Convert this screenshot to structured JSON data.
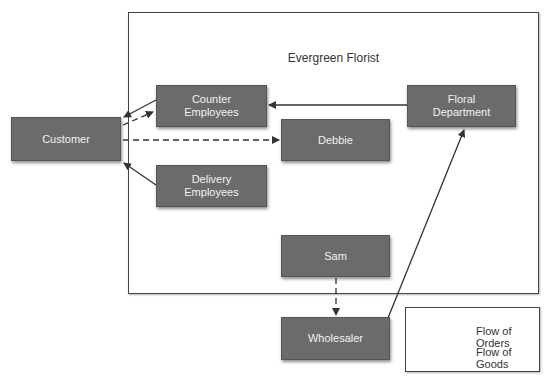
{
  "frame": {
    "title": "Evergreen Florist"
  },
  "nodes": {
    "customer": "Customer",
    "counter_employees": "Counter\nEmployees",
    "delivery_employees": "Delivery\nEmployees",
    "debbie": "Debbie",
    "floral_department": "Floral\nDepartment",
    "sam": "Sam",
    "wholesaler": "Wholesaler"
  },
  "legend": {
    "orders": "Flow of Orders",
    "goods": "Flow of Goods"
  },
  "edges": [
    {
      "from": "Counter Employees",
      "to": "Customer",
      "type": "goods"
    },
    {
      "from": "Customer",
      "to": "Counter Employees",
      "type": "orders"
    },
    {
      "from": "Customer",
      "to": "Debbie",
      "type": "orders"
    },
    {
      "from": "Delivery Employees",
      "to": "Customer",
      "type": "goods"
    },
    {
      "from": "Floral Department",
      "to": "Counter Employees",
      "type": "goods"
    },
    {
      "from": "Sam",
      "to": "Wholesaler",
      "type": "orders"
    },
    {
      "from": "Wholesaler",
      "to": "Floral Department",
      "type": "goods"
    }
  ],
  "colors": {
    "node_fill": "#6b6b6b",
    "node_text": "#f2f2f2",
    "line": "#333333"
  }
}
